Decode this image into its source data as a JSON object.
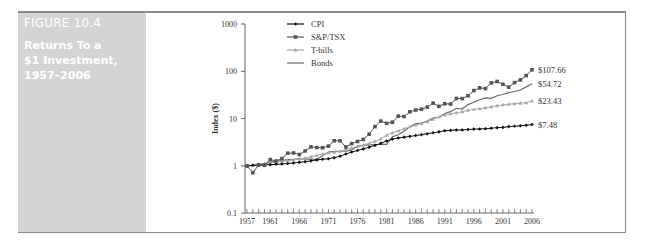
{
  "figure": {
    "number": "FIGURE 10.4",
    "title_lines": [
      "Returns To a",
      "$1 Investment,",
      "1957–2006"
    ]
  },
  "chart_data": {
    "type": "line",
    "title": "Returns To a $1 Investment, 1957–2006",
    "xlabel": "",
    "ylabel": "Index ($)",
    "yscale": "log",
    "ylim": [
      0.1,
      1000
    ],
    "yticks": [
      "0.1",
      "1",
      "10",
      "100",
      "1000"
    ],
    "xlim": [
      1957,
      2006
    ],
    "xtick_labels": [
      "1957",
      "1961",
      "1966",
      "1971",
      "1976",
      "1981",
      "1986",
      "1991",
      "1996",
      "2001",
      "2006"
    ],
    "legend_position": "upper left (inside plot)",
    "grid": false,
    "x": [
      1957,
      1958,
      1959,
      1960,
      1961,
      1962,
      1963,
      1964,
      1965,
      1966,
      1967,
      1968,
      1969,
      1970,
      1971,
      1972,
      1973,
      1974,
      1975,
      1976,
      1977,
      1978,
      1979,
      1980,
      1981,
      1982,
      1983,
      1984,
      1985,
      1986,
      1987,
      1988,
      1989,
      1990,
      1991,
      1992,
      1993,
      1994,
      1995,
      1996,
      1997,
      1998,
      1999,
      2000,
      2001,
      2002,
      2003,
      2004,
      2005,
      2006
    ],
    "series": [
      {
        "name": "CPI",
        "color": "#111111",
        "marker": "diamond",
        "end_label": "$7.48",
        "values": [
          1.0,
          1.03,
          1.04,
          1.05,
          1.06,
          1.08,
          1.1,
          1.12,
          1.15,
          1.19,
          1.23,
          1.28,
          1.34,
          1.38,
          1.42,
          1.49,
          1.6,
          1.78,
          1.97,
          2.12,
          2.29,
          2.49,
          2.72,
          3.0,
          3.37,
          3.68,
          3.88,
          4.05,
          4.21,
          4.39,
          4.58,
          4.77,
          5.01,
          5.25,
          5.54,
          5.65,
          5.75,
          5.76,
          5.88,
          5.99,
          6.04,
          6.1,
          6.25,
          6.44,
          6.51,
          6.77,
          6.9,
          7.05,
          7.21,
          7.48
        ]
      },
      {
        "name": "S&P/TSX",
        "color": "#555555",
        "marker": "square",
        "end_label": "$107.66",
        "values": [
          1.0,
          0.72,
          1.05,
          1.03,
          1.36,
          1.27,
          1.43,
          1.85,
          1.88,
          1.74,
          2.07,
          2.52,
          2.44,
          2.42,
          2.62,
          3.4,
          3.39,
          2.51,
          2.96,
          3.28,
          3.63,
          4.69,
          6.76,
          8.84,
          7.96,
          8.39,
          11.3,
          11.06,
          13.92,
          15.18,
          15.79,
          17.54,
          21.26,
          18.19,
          20.59,
          20.31,
          26.64,
          26.51,
          30.41,
          39.08,
          44.69,
          43.17,
          56.97,
          60.99,
          53.14,
          46.2,
          57.71,
          65.75,
          81.12,
          107.66
        ]
      },
      {
        "name": "T-bills",
        "color": "#a8a8a8",
        "marker": "triangle",
        "end_label": "$23.43",
        "values": [
          1.0,
          1.04,
          1.07,
          1.12,
          1.16,
          1.2,
          1.25,
          1.29,
          1.34,
          1.41,
          1.47,
          1.56,
          1.67,
          1.79,
          1.87,
          1.94,
          2.04,
          2.21,
          2.38,
          2.59,
          2.78,
          2.99,
          3.34,
          3.75,
          4.46,
          5.05,
          5.51,
          6.13,
          6.69,
          7.3,
          7.91,
          8.6,
          9.67,
          10.97,
          11.96,
          12.66,
          13.29,
          13.98,
          15.01,
          15.71,
          16.19,
          16.99,
          17.8,
          18.77,
          19.6,
          20.12,
          20.69,
          21.15,
          21.7,
          23.43
        ]
      },
      {
        "name": "Bonds",
        "color": "#6a6a6a",
        "marker": "none",
        "end_label": "$54.72",
        "values": [
          1.0,
          1.03,
          1.05,
          1.11,
          1.2,
          1.26,
          1.3,
          1.36,
          1.37,
          1.42,
          1.39,
          1.4,
          1.36,
          1.66,
          1.96,
          2.02,
          2.04,
          2.06,
          2.18,
          2.59,
          2.72,
          2.81,
          2.79,
          2.87,
          2.86,
          4.13,
          4.55,
          5.4,
          6.76,
          7.82,
          8.08,
          8.89,
          10.29,
          10.64,
          12.86,
          14.0,
          16.55,
          15.89,
          19.74,
          22.11,
          25.07,
          27.43,
          26.89,
          30.4,
          32.37,
          35.3,
          37.47,
          40.27,
          46.85,
          54.72
        ]
      }
    ]
  }
}
